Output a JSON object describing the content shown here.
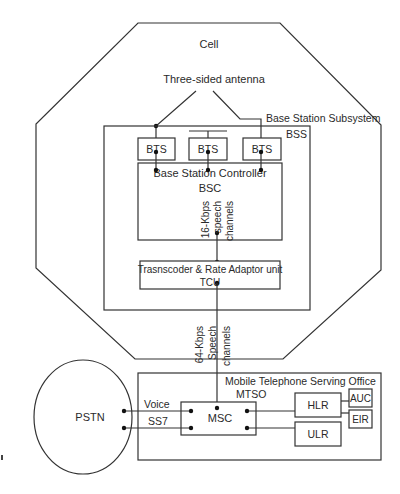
{
  "diagram": {
    "cell": {
      "label": "Cell"
    },
    "antenna": {
      "label": "Three-sided antenna"
    },
    "bss": {
      "title": "Base Station Subsystem",
      "abbr": "BSS"
    },
    "bts": [
      {
        "label": "BTS"
      },
      {
        "label": "BTS"
      },
      {
        "label": "BTS"
      }
    ],
    "bsc": {
      "title": "Base Station Controller",
      "abbr": "BSC",
      "link_label": [
        "16-Kbps",
        "speech",
        "channels"
      ]
    },
    "tcu": {
      "title": "Trasnscoder & Rate Adaptor unit",
      "abbr": "TCU",
      "link_label": [
        "64-Kbps",
        "Speech",
        "channels"
      ]
    },
    "mtso": {
      "title": "Mobile Telephone Serving Office",
      "abbr": "MTSO"
    },
    "pstn": {
      "label": "PSTN"
    },
    "links": {
      "voice": "Voice",
      "ss7": "SS7"
    },
    "msc": {
      "label": "MSC"
    },
    "hlr": {
      "label": "HLR"
    },
    "ulr": {
      "label": "ULR"
    },
    "auc": {
      "label": "AUC"
    },
    "eir": {
      "label": "EIR"
    },
    "colors": {
      "line": "#333333",
      "text": "#2a2a2a",
      "background": "#ffffff"
    }
  }
}
